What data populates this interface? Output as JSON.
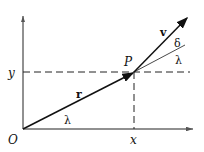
{
  "diagram": {
    "labels": {
      "origin": "O",
      "x_axis": "x",
      "y_axis": "y",
      "point": "P",
      "position_vector": "r",
      "velocity_vector": "v",
      "angle_lambda_origin": "λ",
      "angle_lambda_p": "λ",
      "angle_delta": "δ"
    },
    "colors": {
      "ink": "#111111",
      "background": "#ffffff"
    }
  }
}
